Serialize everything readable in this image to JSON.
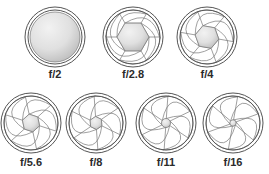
{
  "figure": {
    "background_color": "#ffffff",
    "blade_count": 6,
    "ring_stroke_color": "#555555",
    "blade_stroke_color": "#777777",
    "blade_fill_color": "#ffffff",
    "opening_fill_light": "#f2f2f2",
    "opening_fill_dark": "#b8b8b8",
    "label_color": "#2b2b2b"
  },
  "apertures": [
    {
      "id": "f2",
      "label": "f/2",
      "f_number": 2,
      "row": 1,
      "column": 1,
      "cx": 55,
      "cy": 37,
      "outer_radius": 30,
      "inner_ring_radius": 27,
      "opening_radius": 25,
      "opening_shape": "circle",
      "blades_visible": false,
      "label_x": 25,
      "label_y": 69,
      "label_width": 60,
      "font_size": 11
    },
    {
      "id": "f2-8",
      "label": "f/2.8",
      "f_number": 2.8,
      "row": 1,
      "column": 2,
      "cx": 133,
      "cy": 37,
      "outer_radius": 30,
      "inner_ring_radius": 27,
      "opening_radius": 16,
      "opening_shape": "hexagon",
      "blades_visible": true,
      "blade_rotation": 0,
      "label_x": 103,
      "label_y": 69,
      "label_width": 60,
      "font_size": 11
    },
    {
      "id": "f4",
      "label": "f/4",
      "f_number": 4,
      "row": 1,
      "column": 3,
      "cx": 207,
      "cy": 37,
      "outer_radius": 30,
      "inner_ring_radius": 27,
      "opening_radius": 12,
      "opening_shape": "hexagon",
      "blades_visible": true,
      "blade_rotation": 10,
      "label_x": 177,
      "label_y": 69,
      "label_width": 60,
      "font_size": 11
    },
    {
      "id": "f5-6",
      "label": "f/5.6",
      "f_number": 5.6,
      "row": 2,
      "column": 1,
      "cx": 31,
      "cy": 123,
      "outer_radius": 30,
      "inner_ring_radius": 27,
      "opening_radius": 9,
      "opening_shape": "hexagon",
      "blades_visible": true,
      "blade_rotation": 18,
      "label_x": 1,
      "label_y": 157,
      "label_width": 60,
      "font_size": 11
    },
    {
      "id": "f8",
      "label": "f/8",
      "f_number": 8,
      "row": 2,
      "column": 2,
      "cx": 96,
      "cy": 123,
      "outer_radius": 30,
      "inner_ring_radius": 27,
      "opening_radius": 6.5,
      "opening_shape": "hexagon",
      "blades_visible": true,
      "blade_rotation": 26,
      "label_x": 66,
      "label_y": 157,
      "label_width": 60,
      "font_size": 11
    },
    {
      "id": "f11",
      "label": "f/11",
      "f_number": 11,
      "row": 2,
      "column": 3,
      "cx": 166,
      "cy": 123,
      "outer_radius": 30,
      "inner_ring_radius": 27,
      "opening_radius": 4.5,
      "opening_shape": "circle",
      "blades_visible": true,
      "blade_rotation": 34,
      "label_x": 136,
      "label_y": 157,
      "label_width": 60,
      "font_size": 11
    },
    {
      "id": "f16",
      "label": "f/16",
      "f_number": 16,
      "row": 2,
      "column": 4,
      "cx": 233,
      "cy": 123,
      "outer_radius": 30,
      "inner_ring_radius": 27,
      "opening_radius": 3.2,
      "opening_shape": "circle",
      "blades_visible": true,
      "blade_rotation": 40,
      "label_x": 203,
      "label_y": 157,
      "label_width": 60,
      "font_size": 11
    }
  ]
}
